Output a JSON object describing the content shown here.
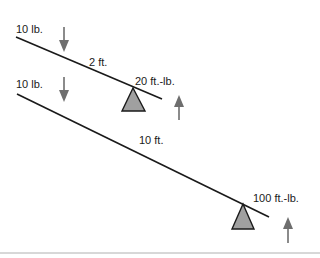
{
  "diagram": {
    "top_lever": {
      "force_label": "10 lb.",
      "distance_label": "2 ft.",
      "torque_label": "20 ft.-lb."
    },
    "bottom_lever": {
      "force_label": "10 lb.",
      "distance_label": "10 ft.",
      "torque_label": "100 ft.-lb."
    },
    "colors": {
      "beam": "#1a1a1a",
      "arrow": "#6e6e6e",
      "fulcrum_fill": "#a0a0a0",
      "fulcrum_stroke": "#1a1a1a",
      "baseline": "#b0b0b0"
    }
  }
}
